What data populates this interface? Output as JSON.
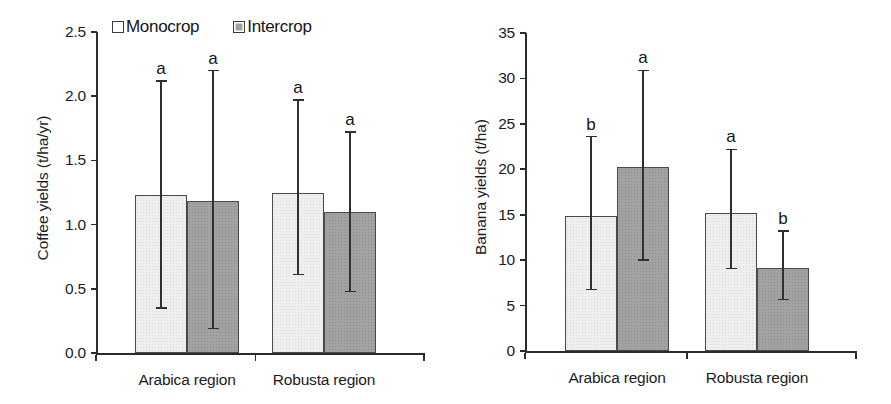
{
  "legend": {
    "position": "top-center",
    "items": [
      {
        "label": "Monocrop",
        "swatch": "light-square-icon",
        "color": "#efefef"
      },
      {
        "label": "Intercrop",
        "swatch": "gray-square-icon",
        "color": "#a2a2a2"
      }
    ]
  },
  "chart_data": [
    {
      "type": "bar",
      "title": "",
      "xlabel": "",
      "ylabel": "Coffee yields (t/ha/yr)",
      "categories": [
        "Arabica region",
        "Robusta region"
      ],
      "ylim": [
        0.0,
        2.5
      ],
      "yticks": [
        "0.0",
        "0.5",
        "1.0",
        "1.5",
        "2.0",
        "2.5"
      ],
      "ytick_values": [
        0.0,
        0.5,
        1.0,
        1.5,
        2.0,
        2.5
      ],
      "grid": false,
      "series": [
        {
          "name": "Monocrop",
          "values": [
            1.23,
            1.25
          ],
          "err_low": [
            0.35,
            0.61
          ],
          "err_high": [
            2.12,
            1.97
          ],
          "annotations": [
            "a",
            "a"
          ]
        },
        {
          "name": "Intercrop",
          "values": [
            1.18,
            1.1
          ],
          "err_low": [
            0.19,
            0.48
          ],
          "err_high": [
            2.2,
            1.72
          ],
          "annotations": [
            "a",
            "a"
          ]
        }
      ]
    },
    {
      "type": "bar",
      "title": "",
      "xlabel": "",
      "ylabel": "Banana yields (t/ha)",
      "categories": [
        "Arabica region",
        "Robusta region"
      ],
      "ylim": [
        0,
        35
      ],
      "yticks": [
        "0",
        "5",
        "10",
        "15",
        "20",
        "25",
        "30",
        "35"
      ],
      "ytick_values": [
        0,
        5,
        10,
        15,
        20,
        25,
        30,
        35
      ],
      "grid": false,
      "series": [
        {
          "name": "Monocrop",
          "values": [
            14.9,
            15.2
          ],
          "err_low": [
            6.8,
            9.1
          ],
          "err_high": [
            23.6,
            22.2
          ],
          "annotations": [
            "b",
            "a"
          ]
        },
        {
          "name": "Intercrop",
          "values": [
            20.3,
            9.1
          ],
          "err_low": [
            10.0,
            5.7
          ],
          "err_high": [
            30.9,
            13.2
          ],
          "annotations": [
            "a",
            "b"
          ]
        }
      ]
    }
  ]
}
